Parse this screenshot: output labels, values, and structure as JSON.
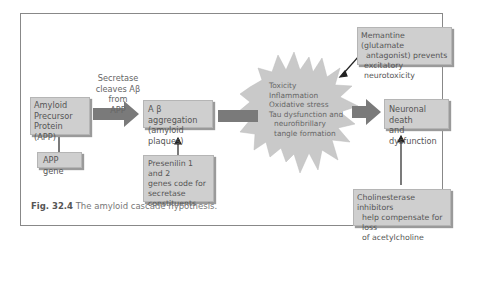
{
  "figure": {
    "caption_number": "Fig. 32.4",
    "caption_text": "The amyloid cascade hypothesis."
  },
  "nodes": {
    "app": "Amyloid Precursor Protein (APP)",
    "app_line1": "Amyloid",
    "app_line2": "Precursor",
    "app_line3": "Protein (APP)",
    "app_gene": "APP gene",
    "abeta_line1": "A β aggregation",
    "abeta_line2": "(amyloid plaques)",
    "presenilin_line1": "Presenilin 1 and 2",
    "presenilin_line2": "genes code for",
    "presenilin_line3": "secretase",
    "presenilin_line4": "constituents",
    "toxicity_items": [
      "Toxicity",
      "Inflammation",
      "Oxidative stress",
      "Tau dysfunction and",
      "neurofibrillary",
      "tangle formation"
    ],
    "memantine_line1": "Memantine (glutamate",
    "memantine_line2": "antagonist) prevents",
    "memantine_line3": "excitatory neurotoxicity",
    "neuronal_line1": "Neuronal death",
    "neuronal_line2": "and dysfunction",
    "cholinesterase_line1": "Cholinesterase inhibitors",
    "cholinesterase_line2": "help compensate for loss",
    "cholinesterase_line3": "of acetylcholine"
  },
  "edges": {
    "secretase_line1": "Secretase",
    "secretase_line2": "cleaves Aβ from",
    "secretase_line3": "APP"
  },
  "colors": {
    "box_fill": "#cfcfcf",
    "arrow_fill": "#7a7a7a",
    "star_fill": "#c9c9c9",
    "frame": "#888888"
  }
}
